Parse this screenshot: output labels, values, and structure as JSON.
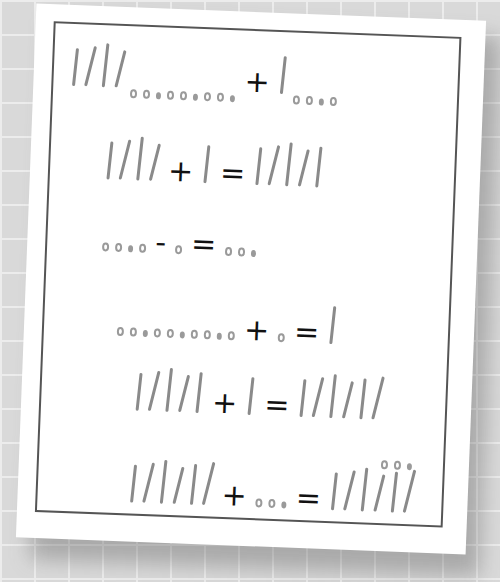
{
  "scene": {
    "description": "Handwritten worksheet of tally-mark and dot arithmetic on a slightly rotated sheet over a gray grid background",
    "colors": {
      "background": "#d9d9d9",
      "grid": "#ececec",
      "paper": "#ffffff",
      "frame": "#555555",
      "marks": "#8a8a8a",
      "operators": "#111111"
    }
  },
  "equations": [
    {
      "id": 1,
      "parts": [
        {
          "type": "tally",
          "count": 4
        },
        {
          "type": "dots",
          "count": 9,
          "subscript": true
        },
        {
          "type": "op",
          "symbol": "+"
        },
        {
          "type": "tally",
          "count": 1
        },
        {
          "type": "dots",
          "count": 4,
          "subscript": true
        }
      ]
    },
    {
      "id": 2,
      "parts": [
        {
          "type": "tally",
          "count": 4
        },
        {
          "type": "op",
          "symbol": "+"
        },
        {
          "type": "tally",
          "count": 1
        },
        {
          "type": "op",
          "symbol": "="
        },
        {
          "type": "tally",
          "count": 5
        }
      ]
    },
    {
      "id": 3,
      "parts": [
        {
          "type": "dots",
          "count": 4
        },
        {
          "type": "op",
          "symbol": "-"
        },
        {
          "type": "dots",
          "count": 1
        },
        {
          "type": "op",
          "symbol": "="
        },
        {
          "type": "dots",
          "count": 3
        }
      ]
    },
    {
      "id": 4,
      "parts": [
        {
          "type": "dots",
          "count": 10
        },
        {
          "type": "op",
          "symbol": "+"
        },
        {
          "type": "dots",
          "count": 1
        },
        {
          "type": "op",
          "symbol": "="
        },
        {
          "type": "tally",
          "count": 1
        }
      ]
    },
    {
      "id": 5,
      "parts": [
        {
          "type": "tally",
          "count": 5
        },
        {
          "type": "op",
          "symbol": "+"
        },
        {
          "type": "tally",
          "count": 1
        },
        {
          "type": "op",
          "symbol": "="
        },
        {
          "type": "tally",
          "count": 6
        }
      ]
    },
    {
      "id": 6,
      "parts": [
        {
          "type": "tally",
          "count": 6
        },
        {
          "type": "op",
          "symbol": "+"
        },
        {
          "type": "dots",
          "count": 3
        },
        {
          "type": "op",
          "symbol": "="
        },
        {
          "type": "tally",
          "count": 6
        },
        {
          "type": "dots",
          "count": 3,
          "superscript": true
        }
      ]
    }
  ],
  "symbols": {
    "plus": "+",
    "minus": "−",
    "equals": "="
  }
}
